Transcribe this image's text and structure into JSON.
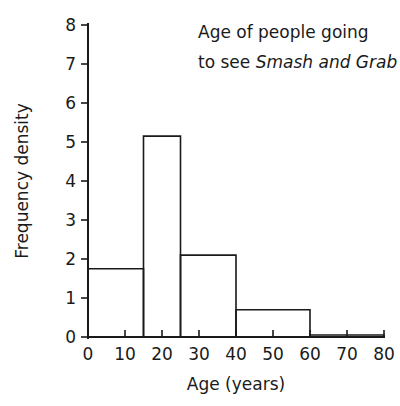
{
  "chart_data": {
    "type": "bar",
    "title": "Age of people going to see Smash and Grab",
    "title_line1": "Age of people going",
    "title_line2_prefix": "to see ",
    "title_line2_italic": "Smash and Grab",
    "xlabel": "Age (years)",
    "ylabel": "Frequency density",
    "xlim": [
      0,
      80
    ],
    "ylim": [
      0,
      8
    ],
    "grid": false,
    "legend": null,
    "x_ticks": [
      0,
      10,
      20,
      30,
      40,
      50,
      60,
      70,
      80
    ],
    "x_tick_labels": [
      "0",
      "10",
      "20",
      "30",
      "40",
      "50",
      "60",
      "70",
      "80"
    ],
    "x_major_ticks": [
      15,
      25,
      40,
      60
    ],
    "y_ticks": [
      0,
      1,
      2,
      3,
      4,
      5,
      6,
      7,
      8
    ],
    "y_tick_labels": [
      "0",
      "1",
      "2",
      "3",
      "4",
      "5",
      "6",
      "7",
      "8"
    ],
    "bins": [
      {
        "label": "0-15",
        "x0": 0,
        "x1": 15,
        "value": 1.75
      },
      {
        "label": "15-25",
        "x0": 15,
        "x1": 25,
        "value": 5.15
      },
      {
        "label": "25-40",
        "x0": 25,
        "x1": 40,
        "value": 2.1
      },
      {
        "label": "40-60",
        "x0": 40,
        "x1": 60,
        "value": 0.7
      },
      {
        "label": "60-80",
        "x0": 60,
        "x1": 80,
        "value": 0.05
      }
    ],
    "colors": {
      "bar_stroke": "#1a1a1a",
      "bar_fill": "none",
      "axis": "#1a1a1a",
      "background": "#ffffff"
    }
  }
}
